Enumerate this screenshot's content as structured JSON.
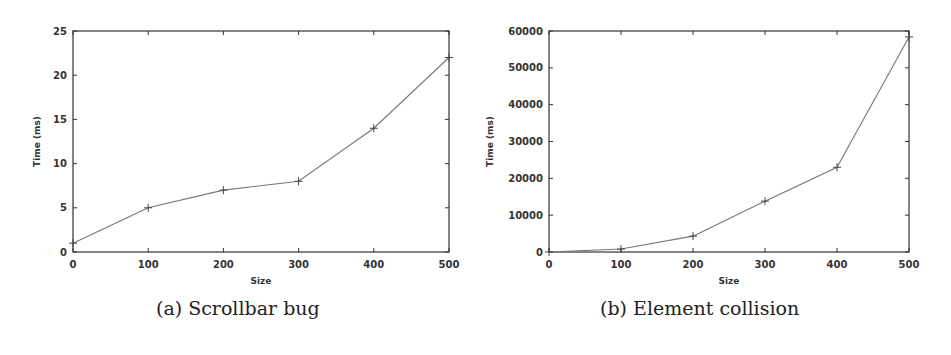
{
  "chart_data": [
    {
      "type": "line",
      "caption": "(a) Scrollbar bug",
      "title": "",
      "xlabel": "Size",
      "ylabel": "Time (ms)",
      "x": [
        0,
        100,
        200,
        300,
        400,
        500
      ],
      "series": [
        {
          "name": "Scrollbar bug",
          "values": [
            1,
            5,
            7,
            8,
            14,
            22
          ]
        }
      ],
      "xlim": [
        0,
        500
      ],
      "ylim": [
        0,
        25
      ],
      "xticks": [
        "0",
        "100",
        "200",
        "300",
        "400",
        "500"
      ],
      "yticks": [
        "0",
        "5",
        "10",
        "15",
        "20",
        "25"
      ],
      "grid": false,
      "legend": null,
      "marker": "+"
    },
    {
      "type": "line",
      "caption": "(b) Element collision",
      "title": "",
      "xlabel": "Size",
      "ylabel": "Time (ms)",
      "x": [
        0,
        100,
        200,
        300,
        400,
        500
      ],
      "series": [
        {
          "name": "Element collision",
          "values": [
            0,
            800,
            4300,
            13800,
            23000,
            58400
          ]
        }
      ],
      "xlim": [
        0,
        500
      ],
      "ylim": [
        0,
        60000
      ],
      "xticks": [
        "0",
        "100",
        "200",
        "300",
        "400",
        "500"
      ],
      "yticks": [
        "0",
        "10000",
        "20000",
        "30000",
        "40000",
        "50000",
        "60000"
      ],
      "grid": false,
      "legend": null,
      "marker": "+"
    }
  ],
  "colors": {
    "axis": "#333333",
    "line": "#777777"
  }
}
